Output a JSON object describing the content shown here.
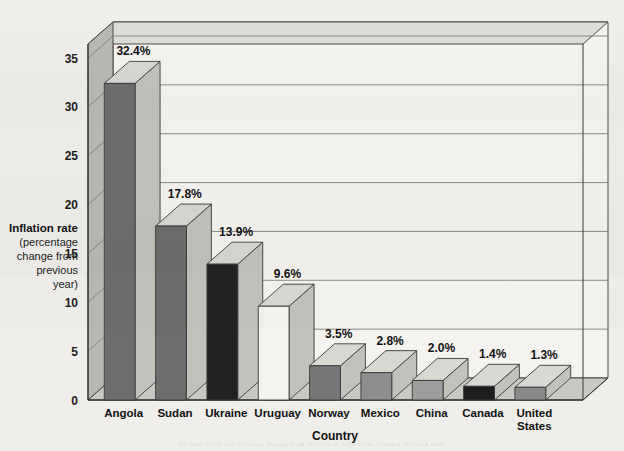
{
  "chart_data": {
    "type": "bar",
    "title": "",
    "xlabel": "Country",
    "ylabel": "Inflation rate (percentage change from previous year)",
    "ylabel_lines": [
      "Inflation rate",
      "(percentage",
      "change from",
      "previous",
      "year)"
    ],
    "categories": [
      "Angola",
      "Sudan",
      "Ukraine",
      "Uruguay",
      "Norway",
      "Mexico",
      "China",
      "Canada",
      "United States"
    ],
    "category_lines": [
      [
        "Angola"
      ],
      [
        "Sudan"
      ],
      [
        "Ukraine"
      ],
      [
        "Uruguay"
      ],
      [
        "Norway"
      ],
      [
        "Mexico"
      ],
      [
        "China"
      ],
      [
        "Canada"
      ],
      [
        "United",
        "States"
      ]
    ],
    "values": [
      32.4,
      17.8,
      13.9,
      9.6,
      3.5,
      2.8,
      2.0,
      1.4,
      1.3
    ],
    "value_labels": [
      "32.4%",
      "17.8%",
      "13.9%",
      "9.6%",
      "3.5%",
      "2.8%",
      "2.0%",
      "1.4%",
      "1.3%"
    ],
    "ylim": [
      0,
      35
    ],
    "yticks": [
      0,
      5,
      10,
      15,
      20,
      25,
      30,
      35
    ],
    "ytick_labels": [
      "0",
      "5",
      "10",
      "15",
      "20",
      "25",
      "30",
      "35"
    ],
    "grid": true,
    "legend": "none",
    "three_d": true,
    "bar_front_colors": [
      "#6d6d6d",
      "#6d6d6d",
      "#222222",
      "#f2f2ee",
      "#777777",
      "#8e8e8e",
      "#9d9d9d",
      "#1d1d1d",
      "#8a8a8a"
    ]
  },
  "style": {
    "page_background": "#efeeea",
    "plot_wall_color": "#f4f3ef",
    "floor_color": "#c9c8c3",
    "side_wall_color": "#b9b8b3",
    "top_wall_color": "#dedcd7",
    "gridline_color": "#808080",
    "outline_color": "#3a3a3a",
    "bar_top_color": "#d8d7d2",
    "bar_side_color": "#c2c1bc"
  },
  "bottom_bleed_text": "the faint offset text bleeding through from the reverse page of the scanned textbook sheet"
}
